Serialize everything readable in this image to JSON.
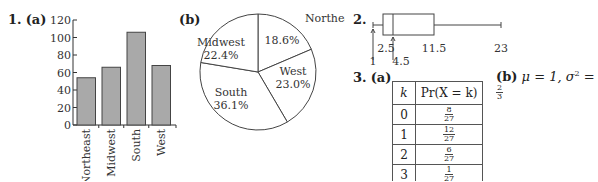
{
  "problems": {
    "p1": {
      "number": "1.",
      "part_a": "(a)",
      "part_b": "(b)"
    },
    "p2": {
      "number": "2."
    },
    "p3": {
      "number": "3.",
      "part_a": "(a)",
      "part_b": "(b)",
      "part_b_answer": "μ = 1, σ² = 2/3",
      "part_b_mu": "μ = 1, ",
      "part_b_sigma": "σ",
      "part_b_exp": "2",
      "part_b_eq": " = ",
      "part_b_num": "2",
      "part_b_den": "3"
    }
  },
  "chart_data": [
    {
      "type": "bar",
      "title": "",
      "categories": [
        "Northeast",
        "Midwest",
        "South",
        "West"
      ],
      "values": [
        54,
        66,
        106,
        68
      ],
      "xlabel": "",
      "ylabel": "",
      "ylim": [
        0,
        120
      ],
      "yticks": [
        0,
        20,
        40,
        60,
        80,
        100,
        120
      ],
      "grid": false,
      "bar_color": "#a9a9a9"
    },
    {
      "type": "pie",
      "categories": [
        "Northeast",
        "West",
        "South",
        "Midwest"
      ],
      "values": [
        18.6,
        23.0,
        36.1,
        22.4
      ],
      "labels": [
        "18.6%",
        "23.0%",
        "36.1%",
        "22.4%"
      ],
      "fill": "#ffffff"
    },
    {
      "type": "boxplot",
      "min": 1,
      "q1": 2.5,
      "median": 4.5,
      "q3": 11.5,
      "max": 23,
      "labels": [
        "1",
        "2.5",
        "4.5",
        "11.5",
        "23"
      ]
    },
    {
      "type": "table",
      "headers": [
        "k",
        "Pr(X = k)"
      ],
      "rows": [
        {
          "k": "0",
          "num": "8",
          "den": "27"
        },
        {
          "k": "1",
          "num": "12",
          "den": "27"
        },
        {
          "k": "2",
          "num": "6",
          "den": "27"
        },
        {
          "k": "3",
          "num": "1",
          "den": "27"
        }
      ]
    }
  ]
}
